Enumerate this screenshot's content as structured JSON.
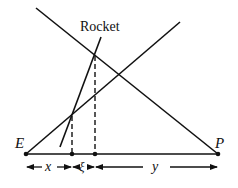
{
  "diagram": {
    "labels": {
      "rocket": "Rocket",
      "earth": "E",
      "planet": "P",
      "x": "x",
      "xi": "ξ",
      "y": "y"
    },
    "colors": {
      "line": "#111111",
      "background": "#ffffff"
    }
  }
}
